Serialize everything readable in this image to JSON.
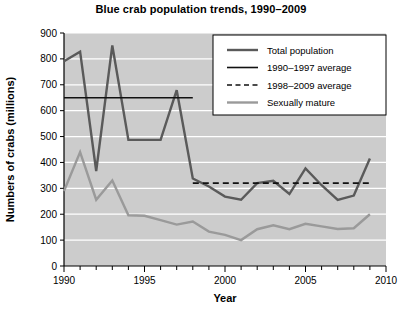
{
  "chart_data": {
    "type": "line",
    "title": "Blue crab population trends, 1990–2009",
    "xlabel": "Year",
    "ylabel": "Numbers of crabs (millions)",
    "xlim": [
      1990,
      2010
    ],
    "ylim": [
      0,
      900
    ],
    "ytick_step": 100,
    "xtick_step": 5,
    "xticks": [
      "1990",
      "1995",
      "2000",
      "2005",
      "2010"
    ],
    "yticks": [
      "0",
      "100",
      "200",
      "300",
      "400",
      "500",
      "600",
      "700",
      "800",
      "900"
    ],
    "grid": "horizontal-white",
    "plot_background": "#cccccc",
    "legend_position": "top-right",
    "x": [
      1990,
      1991,
      1992,
      1993,
      1994,
      1995,
      1996,
      1997,
      1998,
      1999,
      2000,
      2001,
      2002,
      2003,
      2004,
      2005,
      2006,
      2007,
      2008,
      2009
    ],
    "series": [
      {
        "name": "Total population",
        "style": "solid",
        "color": "#5a5a5a",
        "width": 2.4,
        "values": [
          791,
          828,
          367,
          852,
          487,
          487,
          487,
          679,
          338,
          307,
          268,
          256,
          320,
          329,
          278,
          377,
          312,
          255,
          272,
          415
        ]
      },
      {
        "name": "1990–1997 average",
        "style": "solid",
        "color": "#111111",
        "width": 1.6,
        "span": [
          1990,
          1998
        ],
        "value": 650
      },
      {
        "name": "1998–2009 average",
        "style": "dashed",
        "color": "#111111",
        "width": 1.6,
        "span": [
          1998,
          2009
        ],
        "value": 320
      },
      {
        "name": "Sexually mature",
        "style": "solid",
        "color": "#9a9a9a",
        "width": 2.4,
        "values": [
          290,
          440,
          256,
          330,
          196,
          194,
          177,
          160,
          172,
          133,
          120,
          100,
          142,
          157,
          142,
          163,
          153,
          143,
          146,
          200
        ]
      }
    ]
  }
}
